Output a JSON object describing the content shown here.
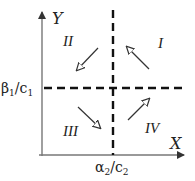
{
  "axes": {
    "y_label": "Y",
    "x_label": "X",
    "y_threshold_label": {
      "base": "β",
      "sub1": "1",
      "slash": "/c",
      "sub2": "1"
    },
    "x_threshold_label": {
      "base": "α",
      "sub1": "2",
      "slash": "/c",
      "sub2": "2"
    }
  },
  "quadrants": [
    {
      "id": "I",
      "label": "I",
      "arrow_direction": "up-left"
    },
    {
      "id": "II",
      "label": "II",
      "arrow_direction": "down-left"
    },
    {
      "id": "III",
      "label": "III",
      "arrow_direction": "down-right"
    },
    {
      "id": "IV",
      "label": "IV",
      "arrow_direction": "up-right"
    }
  ],
  "colors": {
    "axis": "#777777",
    "dashed": "#111111",
    "arrow": "#333333",
    "text": "#222222"
  }
}
